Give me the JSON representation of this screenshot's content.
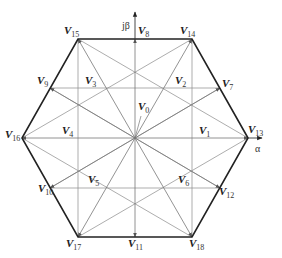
{
  "diagram": {
    "type": "space-vector-hexagon",
    "center": [
      135,
      138
    ],
    "colors": {
      "hexagon": "#222222",
      "lines": "#8a8a8a",
      "vectors": "#777777",
      "text": "#222222"
    },
    "axes": {
      "alpha_label": "α",
      "beta_label": "jβ"
    },
    "points": {
      "V0": {
        "label": "V",
        "sub": "0",
        "x": 135,
        "y": 138
      },
      "V1": {
        "label": "V",
        "sub": "1",
        "x": 192,
        "y": 138
      },
      "V2": {
        "label": "V",
        "sub": "2",
        "x": 163,
        "y": 88
      },
      "V3": {
        "label": "V",
        "sub": "3",
        "x": 107,
        "y": 88
      },
      "V4": {
        "label": "V",
        "sub": "4",
        "x": 78,
        "y": 138
      },
      "V5": {
        "label": "V",
        "sub": "5",
        "x": 107,
        "y": 188
      },
      "V6": {
        "label": "V",
        "sub": "6",
        "x": 163,
        "y": 188
      },
      "V7": {
        "label": "V",
        "sub": "7",
        "x": 220,
        "y": 88
      },
      "V8": {
        "label": "V",
        "sub": "8",
        "x": 135,
        "y": 39
      },
      "V9": {
        "label": "V",
        "sub": "9",
        "x": 50,
        "y": 88
      },
      "V10": {
        "label": "V",
        "sub": "10",
        "x": 50,
        "y": 188
      },
      "V11": {
        "label": "V",
        "sub": "11",
        "x": 135,
        "y": 237
      },
      "V12": {
        "label": "V",
        "sub": "12",
        "x": 220,
        "y": 188
      },
      "V13": {
        "label": "V",
        "sub": "13",
        "x": 248,
        "y": 138
      },
      "V14": {
        "label": "V",
        "sub": "14",
        "x": 192,
        "y": 39
      },
      "V15": {
        "label": "V",
        "sub": "15",
        "x": 78,
        "y": 39
      },
      "V16": {
        "label": "V",
        "sub": "16",
        "x": 22,
        "y": 138
      },
      "V17": {
        "label": "V",
        "sub": "17",
        "x": 78,
        "y": 237
      },
      "V18": {
        "label": "V",
        "sub": "18",
        "x": 192,
        "y": 237
      }
    },
    "labels": [
      {
        "id": "V15",
        "text": "V",
        "sub": "15",
        "x": 64,
        "y": 34
      },
      {
        "id": "V8",
        "text": "V",
        "sub": "8",
        "x": 138,
        "y": 34
      },
      {
        "id": "V14",
        "text": "V",
        "sub": "14",
        "x": 180,
        "y": 34
      },
      {
        "id": "V9",
        "text": "V",
        "sub": "9",
        "x": 37,
        "y": 84
      },
      {
        "id": "V3",
        "text": "V",
        "sub": "3",
        "x": 85,
        "y": 84
      },
      {
        "id": "V2",
        "text": "V",
        "sub": "2",
        "x": 175,
        "y": 84
      },
      {
        "id": "V7",
        "text": "V",
        "sub": "7",
        "x": 222,
        "y": 87
      },
      {
        "id": "V0",
        "text": "V",
        "sub": "0",
        "x": 138,
        "y": 110
      },
      {
        "id": "V16",
        "text": "V",
        "sub": "16",
        "x": 5,
        "y": 138
      },
      {
        "id": "V4",
        "text": "V",
        "sub": "4",
        "x": 62,
        "y": 134
      },
      {
        "id": "V1",
        "text": "V",
        "sub": "1",
        "x": 199,
        "y": 134
      },
      {
        "id": "V13",
        "text": "V",
        "sub": "13",
        "x": 248,
        "y": 133
      },
      {
        "id": "V10",
        "text": "V",
        "sub": "10",
        "x": 38,
        "y": 192
      },
      {
        "id": "V5",
        "text": "V",
        "sub": "5",
        "x": 88,
        "y": 183
      },
      {
        "id": "V6",
        "text": "V",
        "sub": "6",
        "x": 178,
        "y": 183
      },
      {
        "id": "V12",
        "text": "V",
        "sub": "12",
        "x": 219,
        "y": 195
      },
      {
        "id": "V17",
        "text": "V",
        "sub": "17",
        "x": 66,
        "y": 247
      },
      {
        "id": "V11",
        "text": "V",
        "sub": "11",
        "x": 128,
        "y": 247
      },
      {
        "id": "V18",
        "text": "V",
        "sub": "18",
        "x": 189,
        "y": 247
      }
    ]
  }
}
